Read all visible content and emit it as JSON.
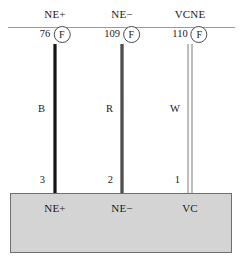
{
  "diagram": {
    "colors": {
      "black_wire": "#151515",
      "red_wire": "#4e4e4e",
      "white_wire": "#fdfdfd",
      "device_fill": "#d4d4d4",
      "device_border": "#6f6f6f",
      "rule": "#9a9a9a"
    },
    "circuits": [
      {
        "circuit_label": "NE+",
        "fuse_number": "76",
        "fuse_symbol": "F",
        "wire_code": "B",
        "terminal_number": "3",
        "device_terminal": "NE+",
        "wire_style": "black"
      },
      {
        "circuit_label": "NE−",
        "fuse_number": "109",
        "fuse_symbol": "F",
        "wire_code": "R",
        "terminal_number": "2",
        "device_terminal": "NE−",
        "wire_style": "red"
      },
      {
        "circuit_label": "VCNE",
        "fuse_number": "110",
        "fuse_symbol": "F",
        "wire_code": "W",
        "terminal_number": "1",
        "device_terminal": "VC",
        "wire_style": "white"
      }
    ]
  }
}
